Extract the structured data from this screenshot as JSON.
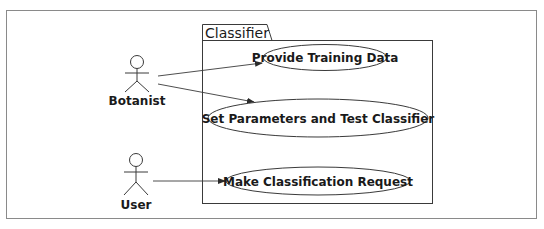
{
  "diagram": {
    "type": "UML use case diagram",
    "colors": {
      "frame": "#8a8a8a",
      "stroke": "#3a3a3a",
      "text": "#1a1a1a",
      "background": "#ffffff"
    },
    "package": {
      "label": "Classifier"
    },
    "actors": [
      {
        "id": "botanist",
        "label": "Botanist"
      },
      {
        "id": "user",
        "label": "User"
      }
    ],
    "use_cases": [
      {
        "id": "uc1",
        "label": "Provide Training Data"
      },
      {
        "id": "uc2",
        "label": "Set Parameters and Test Classifier"
      },
      {
        "id": "uc3",
        "label": "Make Classification Request"
      }
    ],
    "associations": [
      {
        "from": "Botanist",
        "to": "Provide Training Data"
      },
      {
        "from": "Botanist",
        "to": "Set Parameters and Test Classifier"
      },
      {
        "from": "User",
        "to": "Make Classification Request"
      }
    ]
  }
}
